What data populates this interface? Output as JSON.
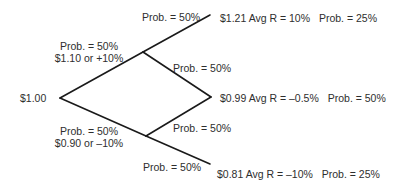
{
  "diagram": {
    "type": "binomial-tree",
    "root": {
      "value": "$1.00"
    },
    "branches": {
      "up": {
        "prob": "Prob. = 50%",
        "outcome": "$1.10 or +10%"
      },
      "down": {
        "prob": "Prob. = 50%",
        "outcome": "$0.90 or –10%"
      }
    },
    "second_step_labels": {
      "up_up": "Prob. = 50%",
      "up_down": "Prob. = 50%",
      "down_up": "Prob. = 50%",
      "down_down": "Prob. = 50%"
    },
    "leaves": [
      {
        "value": "$1.21",
        "avg_r": "Avg R = 10%",
        "prob": "Prob. = 25%"
      },
      {
        "value": "$0.99",
        "avg_r": "Avg R = –0.5%",
        "prob": "Prob. = 50%"
      },
      {
        "value": "$0.81",
        "avg_r": "Avg R = –10%",
        "prob": "Prob. = 25%"
      }
    ],
    "line_color": "#1a1a1a"
  }
}
